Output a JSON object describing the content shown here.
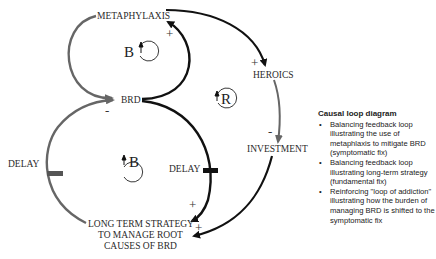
{
  "diagram": {
    "nodes": {
      "metaphylaxis": "METAPHYLAXIS",
      "brd": "BRD",
      "heroics": "HEROICS",
      "investment": "INVESTMENT",
      "long_term_line1": "LONG TERM STRATEGY",
      "long_term_line2": "TO MANAGE ROOT",
      "long_term_line3": "CAUSES OF BRD"
    },
    "delays": {
      "left": "DELAY",
      "right": "DELAY"
    },
    "loops": {
      "top": "B",
      "middle": "R",
      "bottom": "B"
    },
    "signs": {
      "brd_to_metaphylaxis": "+",
      "metaphylaxis_to_brd": "-",
      "metaphylaxis_to_heroics": "+",
      "heroics_to_investment": "-",
      "brd_to_longterm": "+",
      "investment_to_longterm": "+"
    },
    "colors": {
      "gray_link": "#6b6b6b",
      "black_link": "#111111"
    }
  },
  "legend": {
    "title": "Causal loop diagram",
    "items": [
      "Balancing feedback loop illustrating the use of metaphlaxis to mitigate BRD (symptomatic fix)",
      "Balancing feedback loop illustrating long-term strategy (fundamental fix)",
      "Reinforcing \"loop of addiction\" illustrating how the burden of managing BRD is shifted to the symptomatic fix"
    ]
  }
}
